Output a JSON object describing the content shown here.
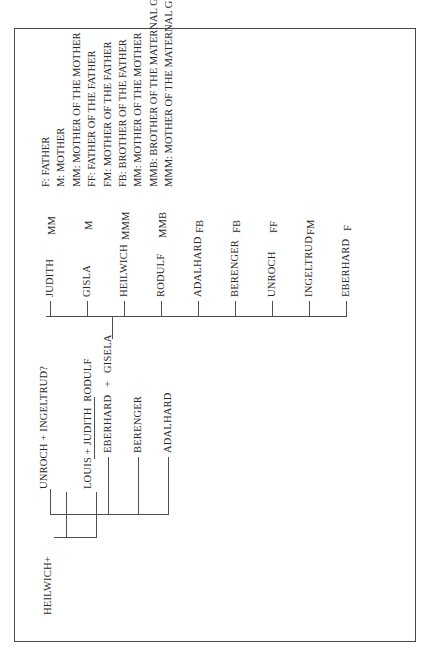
{
  "figure": {
    "title_hidden": "",
    "generations": {
      "g1": [
        {
          "id": "heilwich",
          "label": "HEILWICH+"
        }
      ],
      "g2": [
        {
          "id": "unroch-ingeltrud",
          "label": "UNROCH + INGELTRUD?"
        },
        {
          "id": "louis-judith-rodulf",
          "label": "LOUIS + JUDITH  RODULF"
        }
      ],
      "g3": [
        {
          "id": "adalhard2",
          "label": "ADALHARD"
        },
        {
          "id": "berenger2",
          "label": "BERENGER"
        },
        {
          "id": "eberhard2",
          "label": "EBERHARD"
        },
        {
          "id": "plus",
          "label": "+"
        },
        {
          "id": "gisela2",
          "label": "GISELA"
        }
      ],
      "g4_names": [
        "EBERHARD",
        "INGELTRUD",
        "UNROCH",
        "BERENGER",
        "ADALHARD",
        "RODULF",
        "HEILWICH",
        "GISLA",
        "JUDITH"
      ],
      "g4_codes": [
        "F",
        "FM",
        "FF",
        "FB",
        "FB",
        "MMB",
        "MMM",
        "M",
        "MM"
      ]
    },
    "legend": [
      "F: FATHER",
      "M: MOTHER",
      "MM: MOTHER OF THE MOTHER",
      "FF: FATHER OF THE FATHER",
      "FM: MOTHER OF THE FATHER",
      "FB: BROTHER OF THE FATHER",
      "MM: MOTHER OF THE MOTHER",
      "MMB: BROTHER OF THE MATERNAL GRANDMOTHER",
      "MMM: MOTHER OF THE MATERNAL GRANDMOTHER"
    ],
    "colors": {
      "stroke": "#4f4f4f",
      "text": "#2a2a2a",
      "frame": "#4a4a4a",
      "background": "#ffffff"
    }
  }
}
